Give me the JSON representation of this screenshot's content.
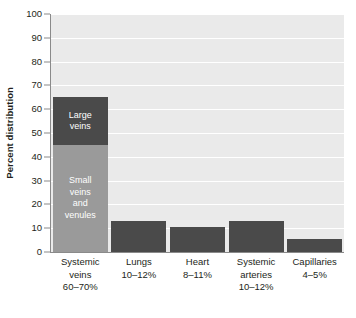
{
  "chart_data": {
    "type": "bar",
    "title": "",
    "xlabel": "",
    "ylabel": "Percent distribution",
    "ylim": [
      0,
      100
    ],
    "grid": true,
    "legend": "none",
    "yticks": [
      0,
      10,
      20,
      30,
      40,
      50,
      60,
      70,
      80,
      90,
      100
    ],
    "ytick_labels": [
      "0",
      "10",
      "20",
      "30",
      "40",
      "50",
      "60",
      "70",
      "80",
      "90",
      "100"
    ],
    "categories": [
      "Systemic\nveins\n60–70%",
      "Lungs\n10–12%",
      "Heart\n8–11%",
      "Systemic\narteries\n10–12%",
      "Capillaries\n4–5%"
    ],
    "category_names": [
      "Systemic veins",
      "Lungs",
      "Heart",
      "Systemic arteries",
      "Capillaries"
    ],
    "category_ranges": [
      "60–70%",
      "10–12%",
      "8–11%",
      "10–12%",
      "4–5%"
    ],
    "values": [
      65,
      13,
      10.5,
      13,
      5.5
    ],
    "stacked_first_bar": {
      "segments": [
        {
          "label": "Large\nveins",
          "value": 20,
          "color": "#4a4a4a"
        },
        {
          "label": "Small\nveins\nand\nvenules",
          "value": 45,
          "color": "#9a9a9a"
        }
      ]
    },
    "colors": {
      "bar": "#4a4a4a",
      "bar_light": "#9a9a9a",
      "plot_background": "#eaeaea",
      "gridline": "#ffffff",
      "axis": "#8a8a8a",
      "text": "#231f20",
      "bar_text": "#ffffff"
    }
  }
}
